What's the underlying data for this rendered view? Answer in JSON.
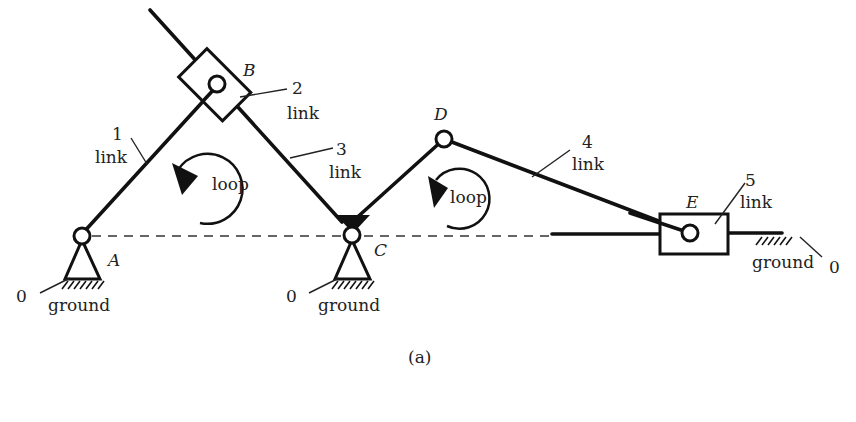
{
  "figure": {
    "caption": "(a)",
    "colors": {
      "stroke": "#111111",
      "background": "#ffffff"
    }
  },
  "points": {
    "A": "A",
    "B": "B",
    "C": "C",
    "D": "D",
    "E": "E"
  },
  "links": [
    {
      "number": "1",
      "label": "link"
    },
    {
      "number": "2",
      "label": "link"
    },
    {
      "number": "3",
      "label": "link"
    },
    {
      "number": "4",
      "label": "link"
    },
    {
      "number": "5",
      "label": "link"
    }
  ],
  "grounds": [
    {
      "number": "0",
      "label": "ground"
    },
    {
      "number": "0",
      "label": "ground"
    },
    {
      "number": "0",
      "label": "ground"
    }
  ],
  "loops": [
    {
      "label": "loop",
      "direction": "counterclockwise"
    },
    {
      "label": "loop",
      "direction": "counterclockwise"
    }
  ]
}
